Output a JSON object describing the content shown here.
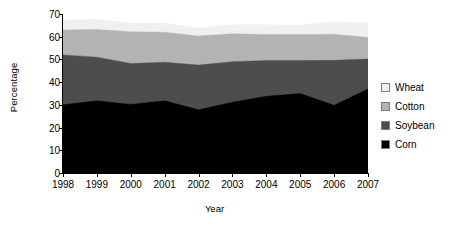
{
  "chart_data": {
    "type": "area",
    "stacked": true,
    "title": "",
    "xlabel": "Year",
    "ylabel": "Percentage",
    "categories": [
      "1998",
      "1999",
      "2000",
      "2001",
      "2002",
      "2003",
      "2004",
      "2005",
      "2006",
      "2007"
    ],
    "x": [
      1998,
      1999,
      2000,
      2001,
      2002,
      2003,
      2004,
      2005,
      2006,
      2007
    ],
    "ylim": [
      0,
      70
    ],
    "yticks": [
      0,
      10,
      20,
      30,
      40,
      50,
      60,
      70
    ],
    "ytick_labels": [
      "0",
      "10",
      "20",
      "30",
      "40",
      "50",
      "60",
      "70"
    ],
    "grid": false,
    "legend_position": "right",
    "series": [
      {
        "name": "Corn",
        "color": "#000000",
        "values": [
          30.0,
          31.8,
          30.2,
          31.8,
          27.8,
          31.2,
          33.8,
          35.0,
          29.8,
          37.0
        ]
      },
      {
        "name": "Soybean",
        "color": "#4d4d4d",
        "values": [
          22.0,
          19.2,
          18.0,
          17.0,
          19.7,
          17.8,
          15.7,
          14.5,
          19.8,
          13.2
        ]
      },
      {
        "name": "Cotton",
        "color": "#b3b3b3",
        "values": [
          11.0,
          12.2,
          14.0,
          13.2,
          12.8,
          12.3,
          11.5,
          11.5,
          11.5,
          9.5
        ]
      },
      {
        "name": "Wheat",
        "color": "#f0f0f0",
        "values": [
          4.2,
          4.5,
          3.8,
          4.0,
          3.5,
          4.0,
          4.3,
          4.2,
          5.5,
          6.5
        ]
      }
    ],
    "cumulative_tops": {
      "Corn": [
        30.0,
        31.8,
        30.2,
        31.8,
        27.8,
        31.2,
        33.8,
        35.0,
        29.8,
        37.0
      ],
      "Corn+Soybean": [
        52.0,
        51.0,
        48.2,
        48.8,
        47.5,
        49.0,
        49.5,
        49.5,
        49.6,
        50.2
      ],
      "Corn+Soy+Cotton": [
        63.0,
        63.2,
        62.2,
        62.0,
        60.3,
        61.3,
        61.0,
        61.0,
        61.1,
        59.7
      ],
      "Total": [
        67.2,
        67.7,
        66.0,
        66.0,
        63.8,
        65.3,
        65.3,
        65.2,
        66.6,
        66.2
      ]
    }
  },
  "legend": {
    "items": [
      {
        "label": "Wheat",
        "swatch": "#f0f0f0"
      },
      {
        "label": "Cotton",
        "swatch": "#b3b3b3"
      },
      {
        "label": "Soybean",
        "swatch": "#4d4d4d"
      },
      {
        "label": "Corn",
        "swatch": "#000000"
      }
    ]
  },
  "axes": {
    "y_title": "Percentage",
    "x_title": "Year"
  }
}
